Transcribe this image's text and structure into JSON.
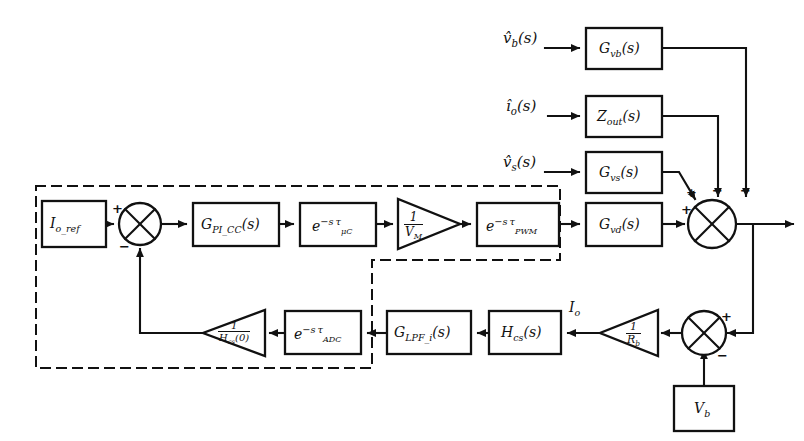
{
  "diagram": {
    "type": "control-block-diagram",
    "line_color": "#111111",
    "dashed_color": "#111111",
    "background": "#ffffff"
  },
  "inputs": [
    {
      "name": "vb-input-label",
      "text": "v̂_b(s)",
      "x": 505,
      "y": 36,
      "html": "<i>v̂</i><sub><i>b</i></sub>(<i>s</i>)"
    },
    {
      "name": "io-input-label",
      "text": "î_o(s)",
      "x": 508,
      "y": 106,
      "html": "<i>î</i><sub><i>o</i></sub>(<i>s</i>)"
    },
    {
      "name": "vs-input-label",
      "text": "v̂_s(s)",
      "x": 505,
      "y": 156,
      "html": "<i>v̂</i><sub><i>s</i></sub>(<i>s</i>)"
    }
  ],
  "blocks": [
    {
      "name": "block-io-ref",
      "label": "I_o_ref",
      "x": 42,
      "y": 201,
      "w": 64,
      "h": 46
    },
    {
      "name": "block-gpi-cc",
      "label": "G_PI_CC(s)",
      "x": 193,
      "y": 203,
      "w": 86,
      "h": 43
    },
    {
      "name": "block-delay-uc",
      "label": "e^{-s τ_μC}",
      "x": 300,
      "y": 203,
      "w": 76,
      "h": 43
    },
    {
      "name": "block-delay-pwm",
      "label": "e^{-s τ_PWM}",
      "x": 477,
      "y": 203,
      "w": 82,
      "h": 43
    },
    {
      "name": "block-gvd",
      "label": "G_vd(s)",
      "x": 586,
      "y": 203,
      "w": 76,
      "h": 43
    },
    {
      "name": "block-gvb",
      "label": "G_vb(s)",
      "x": 586,
      "y": 28,
      "w": 76,
      "h": 41
    },
    {
      "name": "block-zout",
      "label": "Z_out(s)",
      "x": 586,
      "y": 96,
      "w": 76,
      "h": 41
    },
    {
      "name": "block-gvs",
      "label": "G_vs(s)",
      "x": 586,
      "y": 152,
      "w": 76,
      "h": 41
    },
    {
      "name": "block-delay-adc",
      "label": "e^{-s τ_ADC}",
      "x": 285,
      "y": 311,
      "w": 76,
      "h": 43
    },
    {
      "name": "block-glpf-i",
      "label": "G_LPF_i(s)",
      "x": 387,
      "y": 311,
      "w": 84,
      "h": 43
    },
    {
      "name": "block-hcs",
      "label": "H_cs(s)",
      "x": 489,
      "y": 311,
      "w": 72,
      "h": 43
    },
    {
      "name": "block-vb",
      "label": "V_b",
      "x": 674,
      "y": 386,
      "w": 60,
      "h": 45
    }
  ],
  "gain_triangles": [
    {
      "name": "gain-1-over-vm",
      "numerator": "1",
      "denominator": "V_M",
      "x": 398,
      "y": 200,
      "w": 62,
      "h": 50,
      "dir": "right"
    },
    {
      "name": "gain-1-over-hcs0",
      "numerator": "1",
      "denominator": "H_cs(0)",
      "x": 203,
      "y": 310,
      "w": 62,
      "h": 46,
      "dir": "left"
    },
    {
      "name": "gain-1-over-rb",
      "numerator": "1",
      "denominator": "R_b",
      "x": 600,
      "y": 309,
      "w": 58,
      "h": 46,
      "dir": "left"
    }
  ],
  "summing_junctions": [
    {
      "name": "summing-junction-input",
      "cx": 140,
      "cy": 224,
      "r": 21,
      "signs": [
        {
          "label": "+",
          "position": "left",
          "x": 113,
          "y": 205
        },
        {
          "label": "-",
          "position": "bottom",
          "x": 120,
          "y": 243
        }
      ]
    },
    {
      "name": "summing-junction-output",
      "cx": 712,
      "cy": 224,
      "r": 24,
      "signs": [
        {
          "label": "+",
          "position": "top-left-diagonal",
          "x": 688,
          "y": 190
        },
        {
          "label": "-",
          "position": "top-middle",
          "x": 714,
          "y": 188
        },
        {
          "label": "-",
          "position": "top-right",
          "x": 742,
          "y": 188
        },
        {
          "label": "+",
          "position": "left",
          "x": 684,
          "y": 206
        }
      ]
    },
    {
      "name": "summing-junction-bottom",
      "cx": 704,
      "cy": 333,
      "r": 22,
      "signs": [
        {
          "label": "+",
          "position": "right",
          "x": 722,
          "y": 312
        },
        {
          "label": "-",
          "position": "bottom",
          "x": 718,
          "y": 354
        }
      ]
    }
  ],
  "signal_labels": [
    {
      "name": "io-signal-label",
      "text": "I_o",
      "x": 570,
      "y": 304
    }
  ],
  "dashed_regions": [
    {
      "name": "controller-boundary-region",
      "description": "L-shaped dashed controller boundary"
    }
  ]
}
